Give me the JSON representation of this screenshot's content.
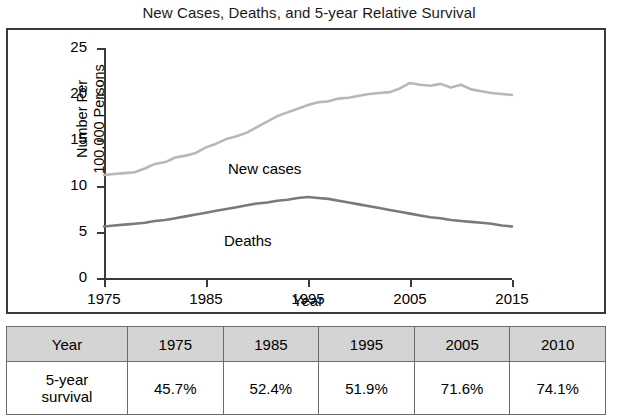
{
  "title": "New Cases, Deaths, and 5-year Relative Survival",
  "chart_data": {
    "type": "line",
    "title": "New Cases, Deaths, and 5-year Relative Survival",
    "xlabel": "Year",
    "ylabel": "Number Per 100,000 Persons",
    "xlim": [
      1975,
      2015
    ],
    "ylim": [
      0,
      25
    ],
    "ytick_labels": [
      "0",
      "5",
      "10",
      "15",
      "20",
      "25"
    ],
    "yticks": [
      0,
      5,
      10,
      15,
      20,
      25
    ],
    "xtick_labels": [
      "1975",
      "1985",
      "1995",
      "2005",
      "2015"
    ],
    "xticks": [
      1975,
      1985,
      1995,
      2005,
      2015
    ],
    "grid": false,
    "legend": "inline-labels",
    "series": [
      {
        "name": "New cases",
        "color": "#b8b8b8",
        "x": [
          1975,
          1976,
          1977,
          1978,
          1979,
          1980,
          1981,
          1982,
          1983,
          1984,
          1985,
          1986,
          1987,
          1988,
          1989,
          1990,
          1991,
          1992,
          1993,
          1994,
          1995,
          1996,
          1997,
          1998,
          1999,
          2000,
          2001,
          2002,
          2003,
          2004,
          2005,
          2006,
          2007,
          2008,
          2009,
          2010,
          2011,
          2012,
          2013,
          2014,
          2015
        ],
        "values": [
          11.2,
          11.3,
          11.4,
          11.5,
          11.9,
          12.4,
          12.6,
          13.1,
          13.3,
          13.6,
          14.2,
          14.6,
          15.1,
          15.4,
          15.8,
          16.4,
          17.0,
          17.6,
          18.0,
          18.4,
          18.8,
          19.1,
          19.2,
          19.5,
          19.6,
          19.8,
          20.0,
          20.1,
          20.2,
          20.6,
          21.2,
          21.0,
          20.9,
          21.1,
          20.7,
          21.0,
          20.5,
          20.3,
          20.1,
          20.0,
          19.9
        ]
      },
      {
        "name": "Deaths",
        "color": "#7a7a7a",
        "x": [
          1975,
          1976,
          1977,
          1978,
          1979,
          1980,
          1981,
          1982,
          1983,
          1984,
          1985,
          1986,
          1987,
          1988,
          1989,
          1990,
          1991,
          1992,
          1993,
          1994,
          1995,
          1996,
          1997,
          1998,
          1999,
          2000,
          2001,
          2002,
          2003,
          2004,
          2005,
          2006,
          2007,
          2008,
          2009,
          2010,
          2011,
          2012,
          2013,
          2014,
          2015
        ],
        "values": [
          5.6,
          5.7,
          5.8,
          5.9,
          6.0,
          6.2,
          6.3,
          6.5,
          6.7,
          6.9,
          7.1,
          7.3,
          7.5,
          7.7,
          7.9,
          8.1,
          8.2,
          8.4,
          8.5,
          8.7,
          8.8,
          8.7,
          8.6,
          8.4,
          8.2,
          8.0,
          7.8,
          7.6,
          7.4,
          7.2,
          7.0,
          6.8,
          6.6,
          6.5,
          6.3,
          6.2,
          6.1,
          6.0,
          5.9,
          5.7,
          5.6
        ]
      }
    ],
    "series_labels": [
      {
        "name": "New cases",
        "text": "New cases"
      },
      {
        "name": "Deaths",
        "text": "Deaths"
      }
    ]
  },
  "table": {
    "header": [
      "Year",
      "1975",
      "1985",
      "1995",
      "2005",
      "2010"
    ],
    "row_label": "5-year survival",
    "row_label_line1": "5-year",
    "row_label_line2": "survival",
    "values": [
      "45.7%",
      "52.4%",
      "51.9%",
      "71.6%",
      "74.1%"
    ]
  }
}
